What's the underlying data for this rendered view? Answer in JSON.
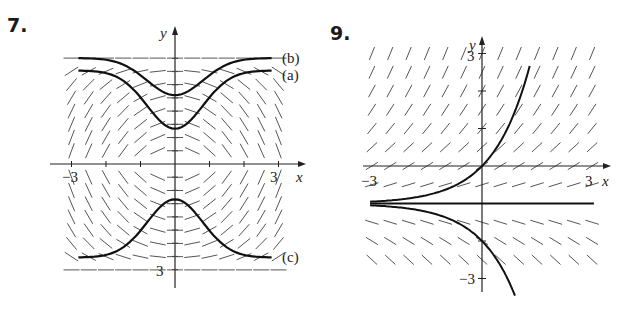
{
  "figure": {
    "left_number": "7.",
    "right_number": "9."
  },
  "chart_data": [
    {
      "type": "line",
      "title": "7.",
      "subtype": "direction field with solution curves",
      "xlabel": "x",
      "ylabel": "y",
      "xlim": [
        -3,
        3
      ],
      "ylim": [
        -3,
        3
      ],
      "x_tick_labels": [
        "-3",
        "3"
      ],
      "y_tick_labels": [
        "3"
      ],
      "grid": false,
      "series": [
        {
          "name": "(b)",
          "description": "upper curve dipping toward center",
          "x": [
            -3,
            -2,
            -1,
            0,
            1,
            2,
            3
          ],
          "y": [
            3,
            2.8,
            2.2,
            1.95,
            2.2,
            2.8,
            3
          ]
        },
        {
          "name": "(a)",
          "description": "middle curve dipping toward center",
          "x": [
            -3,
            -2,
            -1,
            0,
            1,
            2,
            3
          ],
          "y": [
            2.65,
            2.4,
            1.5,
            1.0,
            1.5,
            2.4,
            2.65
          ]
        },
        {
          "name": "(c)",
          "description": "lower curve rising toward center",
          "x": [
            -3,
            -2,
            -1,
            0,
            1,
            2,
            3
          ],
          "y": [
            -2.65,
            -2.4,
            -1.5,
            -1.0,
            -1.5,
            -2.4,
            -2.65
          ]
        }
      ],
      "legend": [
        "(b)",
        "(a)",
        "(c)"
      ],
      "legend_position": "right edge, next to each curve"
    },
    {
      "type": "line",
      "title": "9.",
      "subtype": "direction field with solution curves",
      "xlabel": "x",
      "ylabel": "y",
      "xlim": [
        -3,
        3
      ],
      "ylim": [
        -3,
        3
      ],
      "x_tick_labels": [
        "-3",
        "3"
      ],
      "y_tick_labels": [
        "3",
        "-3"
      ],
      "grid": false,
      "series": [
        {
          "name": "upper solution",
          "description": "y = e^x - 1 (passes origin)",
          "x": [
            -3,
            -2,
            -1,
            0,
            0.5,
            1,
            1.3
          ],
          "y": [
            -0.95,
            -0.86,
            -0.63,
            0,
            0.65,
            1.72,
            2.67
          ]
        },
        {
          "name": "equilibrium",
          "description": "y = -1",
          "x": [
            -3,
            3
          ],
          "y": [
            -1,
            -1
          ]
        },
        {
          "name": "lower solution",
          "description": "y = -e^x - 1",
          "x": [
            -3,
            -2,
            -1,
            0,
            0.5,
            0.9
          ],
          "y": [
            -1.05,
            -1.14,
            -1.37,
            -2,
            -2.65,
            -3.46
          ]
        }
      ],
      "legend": [],
      "legend_position": "none"
    }
  ]
}
